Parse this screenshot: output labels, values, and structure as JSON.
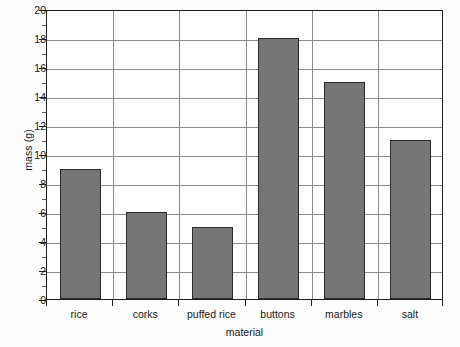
{
  "chart_data": {
    "type": "bar",
    "title": "",
    "xlabel": "material",
    "ylabel": "mass (g)",
    "categories": [
      "rice",
      "corks",
      "puffed rice",
      "buttons",
      "marbles",
      "salt"
    ],
    "values": [
      9,
      6,
      5,
      18,
      15,
      11
    ],
    "series": [
      {
        "name": "mass (g)",
        "values": [
          9,
          6,
          5,
          18,
          15,
          11
        ]
      }
    ],
    "ylim": [
      0,
      20
    ],
    "y_ticks": [
      0,
      2,
      4,
      6,
      8,
      10,
      12,
      14,
      16,
      18,
      20
    ],
    "y_tick_labels": [
      "0",
      "2",
      "4",
      "6",
      "8",
      "10",
      "12",
      "14",
      "16",
      "18",
      "20"
    ],
    "y_minor_ticks": [
      1,
      3,
      5,
      7,
      9,
      11,
      13,
      15,
      17,
      19
    ],
    "grid": "horizontal-and-vertical",
    "legend": "none",
    "bar_color": "#767676",
    "bar_edge_color": "#2b2b2b",
    "grid_color": "#8c8c8c",
    "axis_color": "#1f1f1f",
    "background_color": "#ffffff"
  }
}
